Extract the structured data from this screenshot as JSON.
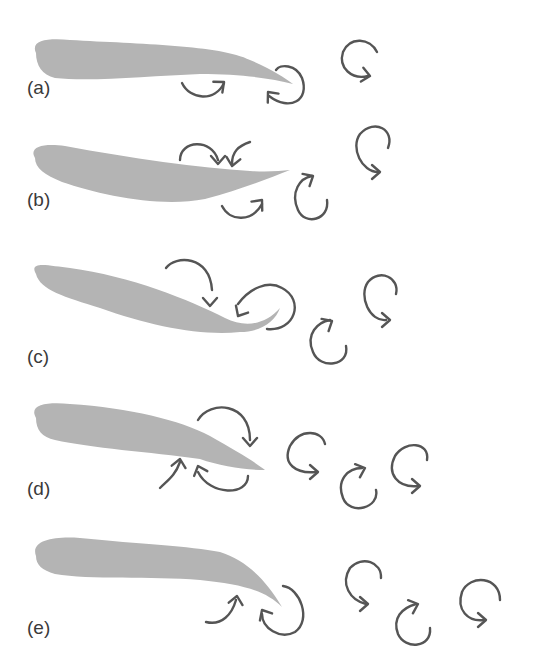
{
  "colors": {
    "foil": "#b4b4b4",
    "arrow": "#555555",
    "label": "#3a3a3a",
    "background": "#ffffff"
  },
  "panels": [
    {
      "id": "a",
      "label": "(a)",
      "label_pos": [
        27,
        95
      ],
      "foil": "M36,53 C30,40 48,38 70,40 C140,44 220,45 250,60 C270,68 285,78 293,84 C270,78 240,74 200,74 C150,76 90,82 55,78 C42,75 36,65 36,53 Z",
      "vortices": [
        {
          "d": "M182,83 C190,100 215,102 224,83",
          "head": [
            224,
            82,
            -40
          ],
          "rot": "ccw"
        },
        {
          "d": "M269,96 C290,112 310,100 302,78 C296,64 280,64 276,70",
          "head": [
            268,
            92,
            -130
          ],
          "rot": "cw"
        },
        {
          "d": "M377,52 C370,38 350,36 343,52 C338,68 352,80 368,76",
          "head": [
            370,
            76,
            10
          ],
          "rot": "cw"
        }
      ]
    },
    {
      "id": "b",
      "label": "(b)",
      "label_pos": [
        27,
        207
      ],
      "foil": "M35,158 C28,146 45,143 65,146 C130,158 200,168 250,171 C268,172 280,171 290,170 C270,178 240,190 205,199 C160,208 100,195 62,182 C45,175 35,168 35,158 Z",
      "vortices": [
        {
          "d": "M180,160 C180,140 212,138 218,160",
          "head": [
            218,
            164,
            90
          ],
          "rot": "cw"
        },
        {
          "d": "M250,142 C238,146 232,152 232,164",
          "head": [
            232,
            166,
            100
          ],
          "rot": "cw"
        },
        {
          "d": "M222,206 C230,222 252,222 262,204",
          "head": [
            262,
            200,
            -50
          ],
          "rot": "ccw"
        },
        {
          "d": "M327,200 C330,220 305,226 298,210 C290,192 300,178 312,176",
          "head": [
            313,
            176,
            -30
          ],
          "rot": "cw"
        },
        {
          "d": "M388,148 C395,130 375,118 360,134 C350,148 362,172 378,172",
          "head": [
            380,
            172,
            0
          ],
          "rot": "cw"
        }
      ]
    },
    {
      "id": "c",
      "label": "(c)",
      "label_pos": [
        27,
        364
      ],
      "foil": "M36,274 C28,260 50,266 70,268 C130,276 190,300 225,318 C245,328 265,325 280,308 C275,322 260,332 240,332 C200,336 150,326 100,308 C65,297 40,290 36,274 Z",
      "vortices": [
        {
          "d": "M166,268 C175,255 210,255 212,290",
          "head": [
            210,
            306,
            90
          ],
          "rot": "cw"
        },
        {
          "d": "M267,329 C295,332 305,300 282,288 C268,280 250,288 238,304",
          "head": [
            238,
            316,
            120
          ],
          "rot": "ccw"
        },
        {
          "d": "M346,346 C350,366 320,370 313,352 C305,334 318,322 330,320",
          "head": [
            332,
            321,
            -30
          ],
          "rot": "cw"
        },
        {
          "d": "M396,294 C400,278 380,268 368,282 C358,296 370,322 386,320",
          "head": [
            390,
            320,
            0
          ],
          "rot": "cw"
        }
      ]
    },
    {
      "id": "d",
      "label": "(d)",
      "label_pos": [
        27,
        496
      ],
      "foil": "M36,418 C28,404 48,402 70,404 C130,408 180,420 210,436 C235,450 255,462 265,470 C245,470 220,466 200,459 C150,452 90,448 55,440 C42,437 36,430 36,418 Z",
      "vortices": [
        {
          "d": "M198,420 C210,400 250,402 250,440",
          "head": [
            250,
            446,
            90
          ],
          "rot": "cw"
        },
        {
          "d": "M160,488 C168,480 175,476 180,462",
          "head": [
            180,
            459,
            -80
          ],
          "rot": "ccw"
        },
        {
          "d": "M248,476 C248,496 210,496 198,472",
          "head": [
            198,
            466,
            -110
          ],
          "rot": "ccw"
        },
        {
          "d": "M325,444 C322,430 300,428 290,446 C282,464 296,474 316,472",
          "head": [
            318,
            472,
            0
          ],
          "rot": "cw"
        },
        {
          "d": "M376,490 C380,508 350,516 343,498 C336,480 348,468 362,468",
          "head": [
            365,
            468,
            -20
          ],
          "rot": "cw"
        },
        {
          "d": "M427,460 C430,442 405,440 395,456 C386,474 398,488 418,486",
          "head": [
            420,
            486,
            0
          ],
          "rot": "cw"
        }
      ]
    },
    {
      "id": "e",
      "label": "(e)",
      "label_pos": [
        27,
        635
      ],
      "foil": "M36,556 C30,540 55,536 80,538 C140,544 190,546 220,552 C245,560 265,578 282,607 C265,590 240,584 200,580 C150,576 90,580 55,574 C42,570 36,565 36,556 Z",
      "vortices": [
        {
          "d": "M206,622 C222,626 232,614 236,600",
          "head": [
            237,
            596,
            -80
          ],
          "rot": "ccw"
        },
        {
          "d": "M283,586 C300,588 312,620 295,632 C280,640 262,628 262,614",
          "head": [
            262,
            610,
            -120
          ],
          "rot": "ccw"
        },
        {
          "d": "M381,578 C382,562 362,555 350,568 C340,584 350,600 366,604",
          "head": [
            368,
            604,
            0
          ],
          "rot": "cw"
        },
        {
          "d": "M430,628 C432,648 405,650 398,634 C392,618 402,608 416,604",
          "head": [
            418,
            604,
            -20
          ],
          "rot": "cw"
        },
        {
          "d": "M500,600 C500,576 470,574 462,592 C456,610 468,622 484,620",
          "head": [
            486,
            620,
            0
          ],
          "rot": "cw"
        }
      ]
    }
  ]
}
